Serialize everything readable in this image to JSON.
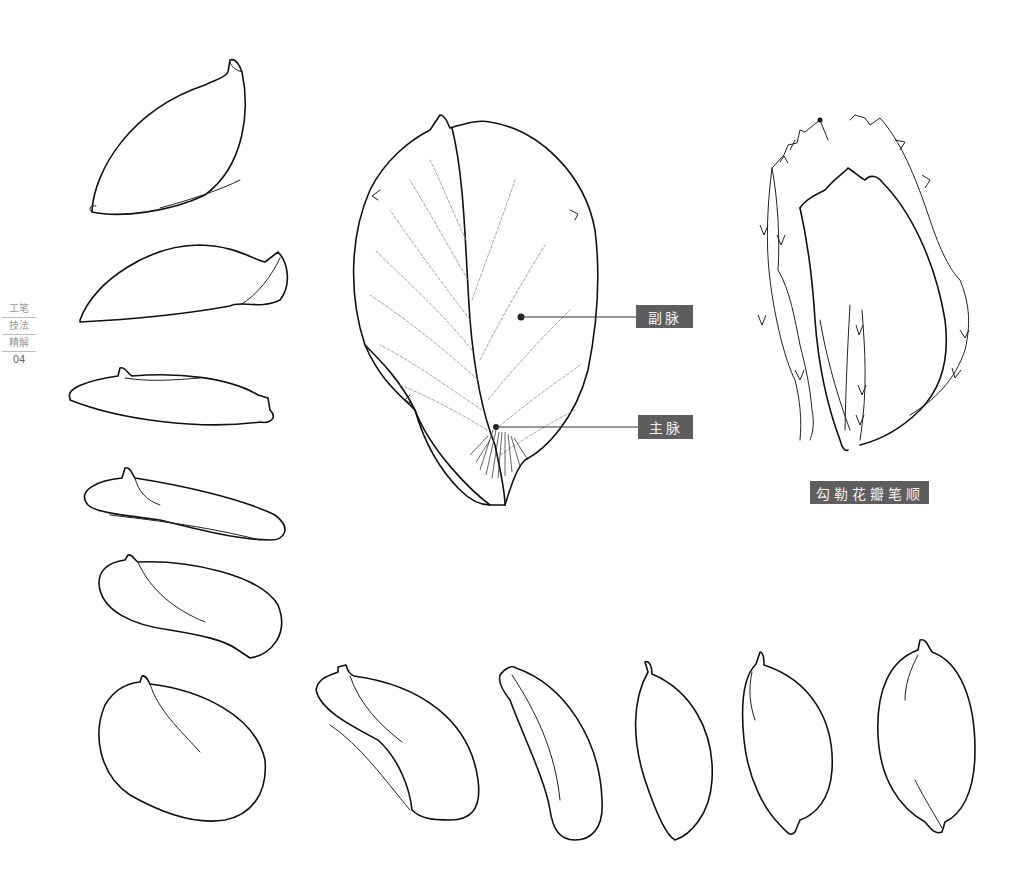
{
  "side_nav": {
    "items": [
      "工笔",
      "技法",
      "精解"
    ],
    "page_number": "04"
  },
  "labels": {
    "secondary_vein": "副脉",
    "main_vein": "主脉",
    "caption": "勾勒花瓣笔顺"
  },
  "colors": {
    "label_background": "#5e5e5e",
    "label_text": "#f2f2f2",
    "ink": "#111111",
    "background": "#ffffff"
  },
  "illustrations": {
    "left_column_petals": 6,
    "bottom_row_petals": 5,
    "central_petal": "petal with main and secondary veins",
    "stroke_order_petal": "petal outline with stroke direction arrows"
  }
}
